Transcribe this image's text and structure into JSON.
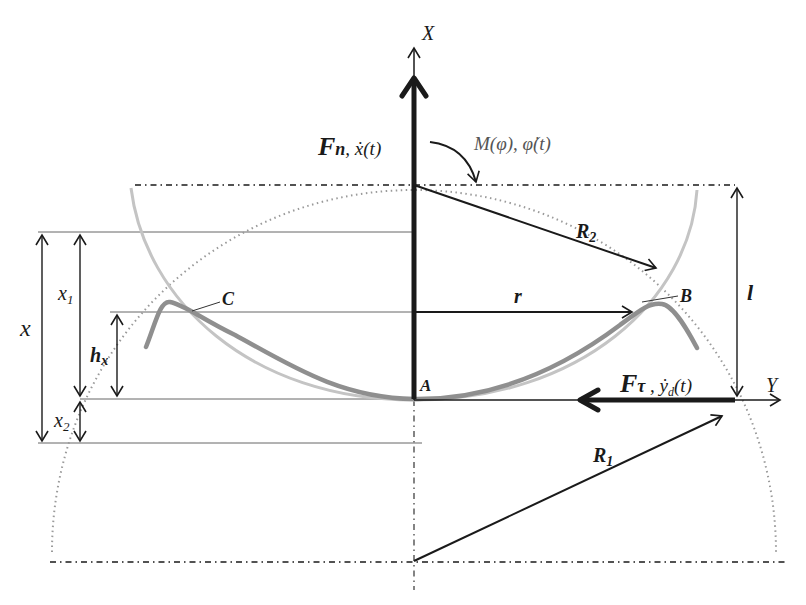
{
  "diagram": {
    "type": "mechanical-force-diagram",
    "axes": {
      "x_axis_label": "X",
      "y_axis_label": "Y"
    },
    "forces": {
      "normal_force": {
        "symbol": "F",
        "subscript": "n",
        "rate": ", ẋ(t)"
      },
      "tangential_force": {
        "symbol": "F",
        "subscript": "τ",
        "rate": " , ẏ",
        "rate_sub": "d",
        "rate_tail": "(t)"
      },
      "moment": "M(φ), φ̇(t)"
    },
    "points": {
      "origin": "A",
      "right_contact": "B",
      "left_contact": "C"
    },
    "dimensions": {
      "radius_1": {
        "symbol": "R",
        "subscript": "1"
      },
      "radius_2": {
        "symbol": "R",
        "subscript": "2"
      },
      "contact_radius": "r",
      "length": "l",
      "total_x": "x",
      "x1": {
        "symbol": "x",
        "subscript": "1"
      },
      "x2": {
        "symbol": "x",
        "subscript": "2"
      },
      "hx": {
        "symbol": "h",
        "subscript": "x"
      }
    },
    "colors": {
      "ink": "#1a1a1a",
      "thin_line": "#555555",
      "arc_light": "#bdbdbd",
      "tube_dark": "#8f8f8f",
      "dotted_circle": "#9a9a9a"
    }
  }
}
